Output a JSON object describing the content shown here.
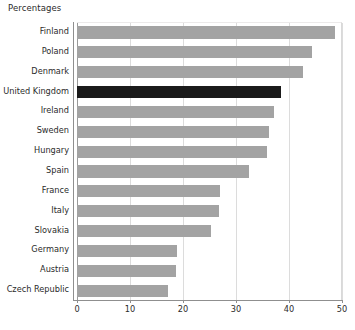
{
  "chart_data": {
    "type": "bar",
    "orientation": "horizontal",
    "title": "Percentages",
    "xlabel": "",
    "ylabel": "",
    "xlim": [
      0,
      50
    ],
    "xticks": [
      0,
      10,
      20,
      30,
      40,
      50
    ],
    "grid": "vertical",
    "legend": "none",
    "categories": [
      "Finland",
      "Poland",
      "Denmark",
      "United Kingdom",
      "Ireland",
      "Sweden",
      "Hungary",
      "Spain",
      "France",
      "Italy",
      "Slovakia",
      "Germany",
      "Austria",
      "Czech Republic"
    ],
    "values": [
      48.7,
      44.3,
      42.6,
      38.5,
      37.2,
      36.2,
      35.8,
      32.5,
      27.0,
      26.8,
      25.3,
      18.9,
      18.7,
      17.2
    ],
    "highlight_category": "United Kingdom",
    "colors": {
      "bar": "#a3a3a3",
      "bar_highlight": "#1a1a1a",
      "gridline": "#dcdcdc",
      "axis": "#8f8f8f",
      "text": "#2b2b2b",
      "background": "#ffffff"
    }
  }
}
